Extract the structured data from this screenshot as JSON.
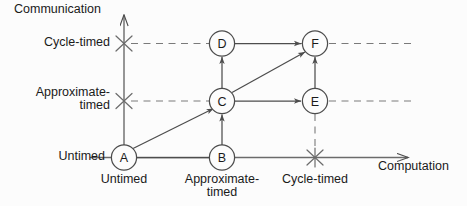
{
  "figure": {
    "type": "diagram",
    "subtitle_none": "",
    "axes": {
      "x": {
        "title": "Computation",
        "ticks": [
          "Untimed",
          "Approximate-\ntimed",
          "Cycle-timed"
        ]
      },
      "y": {
        "title": "Communication",
        "ticks": [
          "Untimed",
          "Approximate-\ntimed",
          "Cycle-timed"
        ]
      }
    },
    "x_tick_0": "Untimed",
    "x_tick_1_line1": "Approximate-",
    "x_tick_1_line2": "timed",
    "x_tick_2": "Cycle-timed",
    "y_tick_0": "Untimed",
    "y_tick_1_line1": "Approximate-",
    "y_tick_1_line2": "timed",
    "y_tick_2": "Cycle-timed",
    "x_axis_title": "Computation",
    "y_axis_title": "Communication",
    "nodes": [
      {
        "id": "A",
        "label": "A",
        "x_level": "Untimed",
        "y_level": "Untimed"
      },
      {
        "id": "B",
        "label": "B",
        "x_level": "Approximate-timed",
        "y_level": "Untimed"
      },
      {
        "id": "C",
        "label": "C",
        "x_level": "Approximate-timed",
        "y_level": "Approximate-timed"
      },
      {
        "id": "D",
        "label": "D",
        "x_level": "Approximate-timed",
        "y_level": "Cycle-timed"
      },
      {
        "id": "E",
        "label": "E",
        "x_level": "Cycle-timed",
        "y_level": "Approximate-timed"
      },
      {
        "id": "F",
        "label": "F",
        "x_level": "Cycle-timed",
        "y_level": "Cycle-timed"
      }
    ],
    "edges": [
      {
        "from": "A",
        "to": "B",
        "arrow": false
      },
      {
        "from": "A",
        "to": "C",
        "arrow": true
      },
      {
        "from": "B",
        "to": "C",
        "arrow": true
      },
      {
        "from": "C",
        "to": "D",
        "arrow": true
      },
      {
        "from": "C",
        "to": "E",
        "arrow": true
      },
      {
        "from": "C",
        "to": "F",
        "arrow": true
      },
      {
        "from": "D",
        "to": "F",
        "arrow": true
      },
      {
        "from": "E",
        "to": "F",
        "arrow": true
      }
    ],
    "colors": {
      "stroke": "#4d4d4d",
      "text": "#1a1a1a",
      "background": "#fcfcfc",
      "guide": "#7a7a7a"
    }
  }
}
